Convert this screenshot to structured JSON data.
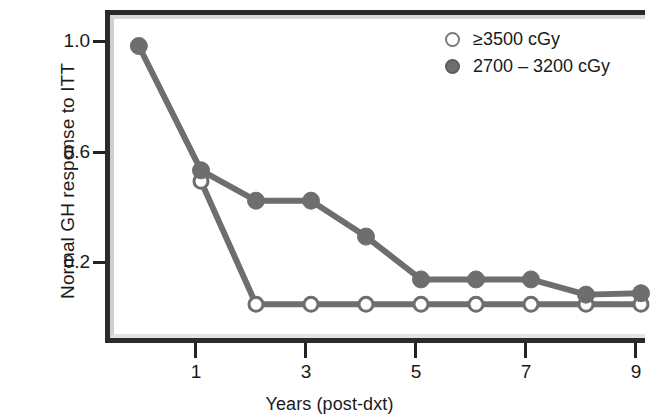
{
  "figure": {
    "background_color": "#ffffff",
    "frame_color": "#2b2b2b"
  },
  "legend": {
    "entries": [
      {
        "label": "≥3500 cGy",
        "marker": "open-circle",
        "color": "#ffffff"
      },
      {
        "label": "2700 – 3200 cGy",
        "marker": "filled-circle",
        "color": "#6e6e6e"
      }
    ]
  },
  "axes": {
    "y_title": "Normal GH response to ITT",
    "x_title": "Years (post-dxt)",
    "y_ticks": [
      "1.0",
      "0.6",
      "0.2"
    ],
    "x_ticks": [
      "1",
      "3",
      "5",
      "7",
      "9"
    ]
  },
  "chart_data": {
    "type": "line",
    "title": "",
    "xlabel": "Years (post-dxt)",
    "ylabel": "Normal GH response to ITT",
    "xlim": [
      -0.55,
      9.2
    ],
    "ylim": [
      0.0,
      1.12
    ],
    "xticks": [
      1,
      3,
      5,
      7,
      9
    ],
    "yticks": [
      1.0,
      0.6,
      0.2
    ],
    "grid": false,
    "legend_position": "top-right",
    "marker_colors": {
      "open": "#ffffff",
      "filled": "#6e6e6e",
      "line": "#6e6e6e"
    },
    "series": [
      {
        "name": "2700 – 3200 cGy",
        "marker": "filled-circle",
        "x": [
          -0.13,
          1,
          2,
          3,
          4,
          5,
          6,
          7,
          8,
          9
        ],
        "values": [
          1.0,
          0.55,
          0.44,
          0.44,
          0.31,
          0.155,
          0.155,
          0.155,
          0.1,
          0.105
        ]
      },
      {
        "name": "≥3500 cGy",
        "marker": "open-circle",
        "x": [
          1,
          2,
          3,
          4,
          5,
          6,
          7,
          8,
          9
        ],
        "values": [
          0.51,
          0.065,
          0.065,
          0.065,
          0.065,
          0.065,
          0.065,
          0.065,
          0.065
        ]
      }
    ]
  }
}
